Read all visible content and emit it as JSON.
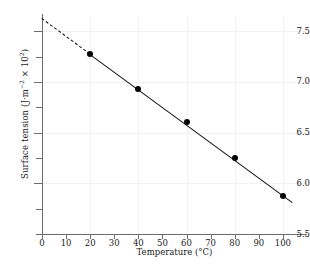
{
  "chart_data": {
    "type": "scatter",
    "title": "",
    "xlabel": "Temperature (°C)",
    "ylabel": "Surface tension (J·m⁻² × 10²)",
    "ylabel_parts": {
      "main": "Surface tension (J·m",
      "sup1": "−2",
      "mid": " × 10",
      "sup2": "2",
      "end": ")"
    },
    "x": [
      20,
      40,
      60,
      80,
      100
    ],
    "values": [
      7.28,
      6.93,
      6.6,
      6.25,
      5.87
    ],
    "xlim": [
      0,
      110
    ],
    "ylim": [
      5.5,
      7.65
    ],
    "xticks": [
      0,
      10,
      20,
      30,
      40,
      50,
      60,
      70,
      80,
      90,
      100
    ],
    "xticklabels": [
      "0",
      "10",
      "20",
      "30",
      "40",
      "50",
      "60",
      "70",
      "80",
      "90",
      "100"
    ],
    "yticks": [
      5.5,
      5.75,
      6.0,
      6.25,
      6.5,
      6.75,
      7.0,
      7.25,
      7.5
    ],
    "ytick_major": [
      6.0,
      6.5,
      7.0,
      7.5
    ],
    "yticklabels": [
      "5.5",
      "6.0",
      "6.5",
      "7.0",
      "7.5"
    ],
    "grid": true,
    "legend": false,
    "fit_line": {
      "style": "solid",
      "x_start": 20,
      "x_end": 104,
      "y_start": 7.28,
      "y_end": 5.82,
      "color": "#111111"
    },
    "extrapolation": {
      "style": "dashed",
      "x_start": 0,
      "x_end": 20,
      "y_start": 7.63,
      "y_end": 7.28,
      "color": "#111111"
    },
    "marker": {
      "shape": "circle",
      "color": "#000000",
      "size": 6
    }
  }
}
